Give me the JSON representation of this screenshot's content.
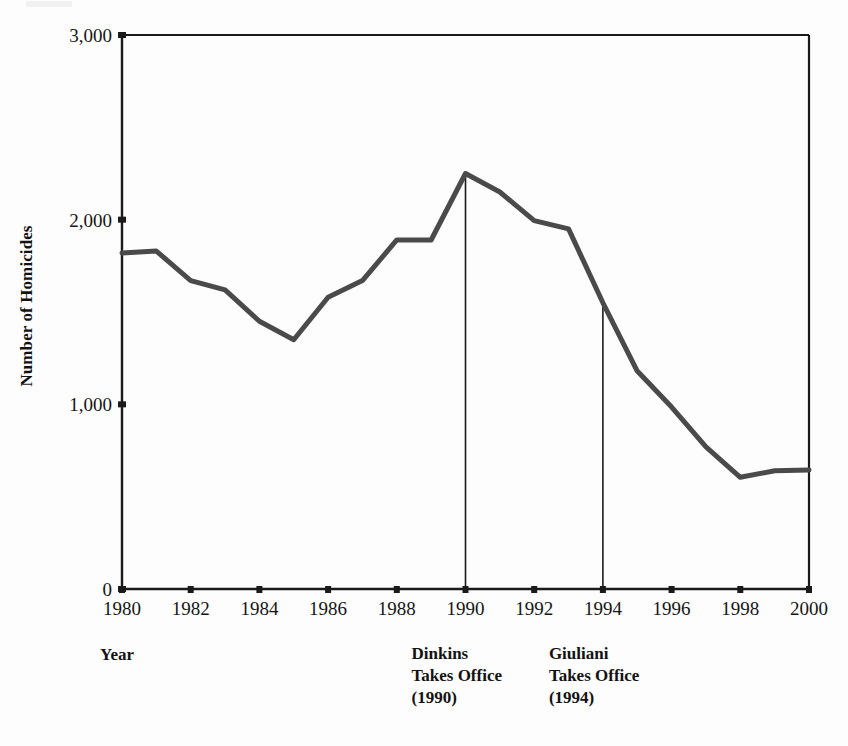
{
  "figure": {
    "y_axis_title": "Number of Homicides",
    "x_axis_title": "Year",
    "line_color": "#4a4a4a",
    "axis_color": "#1a1a1a",
    "background": "#fdfdfd"
  },
  "y_axis": {
    "ticks": [
      {
        "value": 3000,
        "label": "3,000"
      },
      {
        "value": 2000,
        "label": "2,000"
      },
      {
        "value": 1000,
        "label": "1,000"
      },
      {
        "value": 0,
        "label": "0"
      }
    ]
  },
  "x_axis": {
    "ticks": [
      {
        "value": 1980,
        "label": "1980"
      },
      {
        "value": 1982,
        "label": "1982"
      },
      {
        "value": 1984,
        "label": "1984"
      },
      {
        "value": 1986,
        "label": "1986"
      },
      {
        "value": 1988,
        "label": "1988"
      },
      {
        "value": 1990,
        "label": "1990"
      },
      {
        "value": 1992,
        "label": "1992"
      },
      {
        "value": 1994,
        "label": "1994"
      },
      {
        "value": 1996,
        "label": "1996"
      },
      {
        "value": 1998,
        "label": "1998"
      },
      {
        "value": 2000,
        "label": "2000"
      }
    ]
  },
  "annotations": [
    {
      "name": "dinkins",
      "year": 1990,
      "line1": "Dinkins",
      "line2": "Takes Office",
      "line3": "(1990)"
    },
    {
      "name": "giuliani",
      "year": 1994,
      "line1": "Giuliani",
      "line2": "Takes Office",
      "line3": "(1994)"
    }
  ],
  "chart_data": {
    "type": "line",
    "title": "",
    "subtitle": "",
    "xlabel": "Year",
    "ylabel": "Number of Homicides",
    "xlim": [
      1980,
      2000
    ],
    "ylim": [
      0,
      3000
    ],
    "grid": false,
    "legend": "none",
    "x": [
      1980,
      1981,
      1982,
      1983,
      1984,
      1985,
      1986,
      1987,
      1988,
      1989,
      1990,
      1991,
      1992,
      1993,
      1994,
      1995,
      1996,
      1997,
      1998,
      1999,
      2000
    ],
    "values": [
      1820,
      1830,
      1670,
      1620,
      1450,
      1350,
      1580,
      1670,
      1890,
      1890,
      2250,
      2150,
      1995,
      1950,
      1550,
      1180,
      985,
      770,
      605,
      640,
      645
    ],
    "series": [
      {
        "name": "Number of Homicides",
        "values": [
          1820,
          1830,
          1670,
          1620,
          1450,
          1350,
          1580,
          1670,
          1890,
          1890,
          2250,
          2150,
          1995,
          1950,
          1550,
          1180,
          985,
          770,
          605,
          640,
          645
        ]
      }
    ],
    "vertical_markers": [
      {
        "label": "Dinkins Takes Office (1990)",
        "x": 1990
      },
      {
        "label": "Giuliani Takes Office (1994)",
        "x": 1994
      }
    ]
  }
}
